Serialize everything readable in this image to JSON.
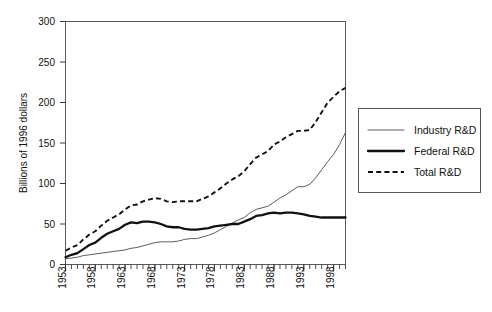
{
  "chart_data": {
    "type": "line",
    "title": "",
    "xlabel": "",
    "ylabel": "Billions of 1996 dollars",
    "xlim": [
      1953,
      2000
    ],
    "ylim": [
      0,
      300
    ],
    "ytick_values": [
      0,
      50,
      100,
      150,
      200,
      250,
      300
    ],
    "ytick_labels": [
      "0",
      "50",
      "100",
      "150",
      "200",
      "250",
      "300"
    ],
    "xtick_values": [
      1953,
      1958,
      1963,
      1968,
      1973,
      1978,
      1983,
      1988,
      1993,
      1998
    ],
    "xtick_labels": [
      "1953",
      "1958",
      "1963",
      "1968",
      "1973",
      "1978",
      "1983",
      "1988",
      "1993",
      "1998"
    ],
    "minor_xtick_interval": 1,
    "grid": false,
    "legend_position": "right-outside",
    "x": [
      1953,
      1954,
      1955,
      1956,
      1957,
      1958,
      1959,
      1960,
      1961,
      1962,
      1963,
      1964,
      1965,
      1966,
      1967,
      1968,
      1969,
      1970,
      1971,
      1972,
      1973,
      1974,
      1975,
      1976,
      1977,
      1978,
      1979,
      1980,
      1981,
      1982,
      1983,
      1984,
      1985,
      1986,
      1987,
      1988,
      1989,
      1990,
      1991,
      1992,
      1993,
      1994,
      1995,
      1996,
      1997,
      1998,
      1999,
      2000
    ],
    "series": [
      {
        "name": "Industry R&D",
        "style": "thin-solid",
        "color": "#4a4a4a",
        "values": [
          7,
          8,
          9,
          11,
          12,
          13,
          14,
          15,
          16,
          17,
          18,
          20,
          21,
          23,
          25,
          27,
          28,
          28,
          28,
          29,
          31,
          32,
          32,
          34,
          36,
          39,
          43,
          47,
          51,
          55,
          58,
          64,
          68,
          70,
          72,
          77,
          82,
          86,
          91,
          96,
          96,
          99,
          107,
          117,
          127,
          136,
          148,
          163
        ]
      },
      {
        "name": "Federal R&D",
        "style": "thick-solid",
        "color": "#111111",
        "values": [
          9,
          12,
          14,
          19,
          24,
          27,
          33,
          38,
          41,
          44,
          49,
          52,
          51,
          53,
          53,
          52,
          50,
          47,
          46,
          46,
          44,
          43,
          43,
          44,
          45,
          47,
          48,
          49,
          50,
          50,
          53,
          56,
          60,
          61,
          63,
          64,
          63,
          64,
          64,
          63,
          62,
          60,
          59,
          58,
          58,
          58,
          58,
          58
        ]
      },
      {
        "name": "Total R&D",
        "style": "dashed",
        "color": "#111111",
        "values": [
          17,
          21,
          24,
          31,
          37,
          41,
          48,
          54,
          58,
          62,
          68,
          73,
          74,
          78,
          80,
          82,
          81,
          78,
          77,
          78,
          78,
          78,
          78,
          81,
          84,
          89,
          94,
          100,
          105,
          109,
          115,
          124,
          132,
          136,
          140,
          148,
          152,
          157,
          161,
          165,
          165,
          166,
          176,
          188,
          200,
          207,
          214,
          218
        ]
      }
    ]
  },
  "legend": {
    "items": [
      {
        "label": "Industry R&D",
        "style": "thin-solid"
      },
      {
        "label": "Federal R&D",
        "style": "thick-solid"
      },
      {
        "label": "Total R&D",
        "style": "dashed"
      }
    ]
  },
  "caption": {
    "text": ""
  }
}
